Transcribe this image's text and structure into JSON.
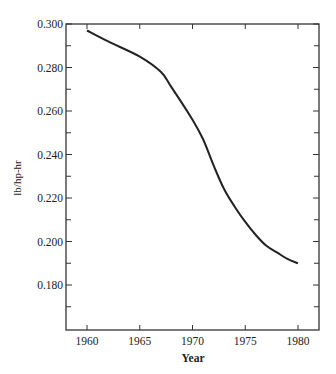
{
  "chart_data": {
    "type": "line",
    "title": "",
    "xlabel": "Year",
    "ylabel": "lb/hp-hr",
    "xlim": [
      1958,
      1982
    ],
    "ylim": [
      0.159,
      0.3
    ],
    "x_ticks": [
      1960,
      1965,
      1970,
      1975,
      1980
    ],
    "x_tick_labels": [
      "1960",
      "1965",
      "1970",
      "1975",
      "1980"
    ],
    "y_ticks": [
      0.3,
      0.28,
      0.26,
      0.24,
      0.22,
      0.2,
      0.18
    ],
    "y_tick_labels": [
      "0.300",
      "0.280",
      "0.260",
      "0.240",
      "0.220",
      "0.200",
      "0.180"
    ],
    "y_minor_ticks": [
      0.29,
      0.27,
      0.25,
      0.23,
      0.21,
      0.19,
      0.17
    ],
    "grid": false,
    "legend": null,
    "series": [
      {
        "name": "lb/hp-hr",
        "color": "#222222",
        "x": [
          1960,
          1962,
          1965,
          1967,
          1968,
          1970,
          1971,
          1972,
          1973,
          1974,
          1975,
          1976,
          1977,
          1978,
          1979,
          1980
        ],
        "values": [
          0.297,
          0.292,
          0.285,
          0.278,
          0.271,
          0.256,
          0.247,
          0.235,
          0.224,
          0.216,
          0.209,
          0.203,
          0.198,
          0.195,
          0.192,
          0.19
        ]
      }
    ]
  }
}
